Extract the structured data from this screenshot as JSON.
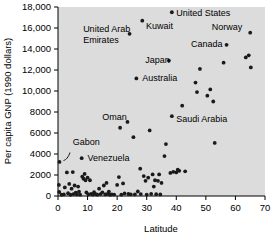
{
  "chart_data": {
    "type": "scatter",
    "title": "",
    "xlabel": "Latitude",
    "ylabel": "Per capita GNP (1990 dollars)",
    "xlim": [
      0,
      70
    ],
    "ylim": [
      0,
      18000
    ],
    "xticks": [
      0,
      10,
      20,
      30,
      40,
      50,
      60,
      70
    ],
    "xtick_labels": [
      "0",
      "10",
      "20",
      "30",
      "40",
      "50",
      "60",
      "70"
    ],
    "yticks": [
      0,
      2000,
      4000,
      6000,
      8000,
      10000,
      12000,
      14000,
      16000,
      18000
    ],
    "ytick_labels": [
      "0",
      "2000",
      "4000",
      "6000",
      "8000",
      "10,000",
      "12,000",
      "14,000",
      "16,000",
      "18,000"
    ],
    "grid": false,
    "legend": false,
    "plot_background": "#dcdcdc",
    "marker_color": "#1a1a1a",
    "annotations": [
      {
        "text": "United Arab",
        "x": 24.2,
        "y": 15450,
        "label_x": 8.5,
        "label_y": 15900,
        "align": "start",
        "line2": "Emirates"
      },
      {
        "text": "Kuwait",
        "x": 28.5,
        "y": 16700,
        "label_x": 29.8,
        "label_y": 16150,
        "align": "start"
      },
      {
        "text": "United States",
        "x": 38.5,
        "y": 17500,
        "label_x": 40.0,
        "label_y": 17450,
        "align": "start"
      },
      {
        "text": "Norway",
        "x": 65.0,
        "y": 15550,
        "label_x": 52.0,
        "label_y": 16050,
        "align": "start"
      },
      {
        "text": "Canada",
        "x": 57.0,
        "y": 14400,
        "label_x": 45.0,
        "label_y": 14450,
        "align": "start"
      },
      {
        "text": "Japan",
        "x": 37.5,
        "y": 12900,
        "label_x": 29.5,
        "label_y": 12950,
        "align": "start"
      },
      {
        "text": "Australia",
        "x": 26.5,
        "y": 11200,
        "label_x": 28.5,
        "label_y": 11200,
        "align": "start"
      },
      {
        "text": "Oman",
        "x": 23.5,
        "y": 7050,
        "label_x": 15.0,
        "label_y": 7550,
        "align": "start"
      },
      {
        "text": "Saudi Arabia",
        "x": 38.5,
        "y": 7600,
        "label_x": 40.0,
        "label_y": 7300,
        "align": "start"
      },
      {
        "text": "Gabon",
        "x": 0.5,
        "y": 3250,
        "label_x": 5.0,
        "label_y": 5100,
        "align": "start"
      },
      {
        "text": "Venezuela",
        "x": 8.0,
        "y": 3600,
        "label_x": 10.0,
        "label_y": 3600,
        "align": "start"
      }
    ],
    "points": [
      {
        "x": 0.5,
        "y": 3250
      },
      {
        "x": 0.3,
        "y": 1050
      },
      {
        "x": 0.4,
        "y": 380
      },
      {
        "x": 1.2,
        "y": 120
      },
      {
        "x": 2.0,
        "y": 150
      },
      {
        "x": 2.3,
        "y": 820
      },
      {
        "x": 3.0,
        "y": 2250
      },
      {
        "x": 3.4,
        "y": 260
      },
      {
        "x": 3.8,
        "y": 1150
      },
      {
        "x": 4.2,
        "y": 120
      },
      {
        "x": 4.6,
        "y": 700
      },
      {
        "x": 5.0,
        "y": 2280
      },
      {
        "x": 5.2,
        "y": 180
      },
      {
        "x": 5.6,
        "y": 1000
      },
      {
        "x": 6.0,
        "y": 330
      },
      {
        "x": 6.4,
        "y": 150
      },
      {
        "x": 6.8,
        "y": 900
      },
      {
        "x": 7.1,
        "y": 420
      },
      {
        "x": 7.5,
        "y": 130
      },
      {
        "x": 8.0,
        "y": 3600
      },
      {
        "x": 8.2,
        "y": 1850
      },
      {
        "x": 8.6,
        "y": 1650
      },
      {
        "x": 9.0,
        "y": 2100
      },
      {
        "x": 9.3,
        "y": 1500
      },
      {
        "x": 9.6,
        "y": 340
      },
      {
        "x": 10.0,
        "y": 1750
      },
      {
        "x": 10.3,
        "y": 160
      },
      {
        "x": 10.8,
        "y": 1500
      },
      {
        "x": 11.2,
        "y": 200
      },
      {
        "x": 11.8,
        "y": 140
      },
      {
        "x": 12.2,
        "y": 360
      },
      {
        "x": 12.8,
        "y": 170
      },
      {
        "x": 13.3,
        "y": 130
      },
      {
        "x": 13.9,
        "y": 700
      },
      {
        "x": 14.4,
        "y": 180
      },
      {
        "x": 15.0,
        "y": 350
      },
      {
        "x": 15.5,
        "y": 1000
      },
      {
        "x": 16.0,
        "y": 150
      },
      {
        "x": 16.4,
        "y": 1250
      },
      {
        "x": 16.8,
        "y": 200
      },
      {
        "x": 17.2,
        "y": 420
      },
      {
        "x": 17.6,
        "y": 120
      },
      {
        "x": 18.2,
        "y": 160
      },
      {
        "x": 19.0,
        "y": 140
      },
      {
        "x": 20.0,
        "y": 1050
      },
      {
        "x": 20.6,
        "y": 1800
      },
      {
        "x": 21.0,
        "y": 6500
      },
      {
        "x": 21.4,
        "y": 130
      },
      {
        "x": 22.0,
        "y": 1200
      },
      {
        "x": 22.5,
        "y": 250
      },
      {
        "x": 23.5,
        "y": 7050
      },
      {
        "x": 23.8,
        "y": 190
      },
      {
        "x": 24.2,
        "y": 15450
      },
      {
        "x": 24.6,
        "y": 160
      },
      {
        "x": 25.5,
        "y": 5600
      },
      {
        "x": 26.0,
        "y": 150
      },
      {
        "x": 26.5,
        "y": 11200
      },
      {
        "x": 27.0,
        "y": 430
      },
      {
        "x": 27.8,
        "y": 2600
      },
      {
        "x": 28.0,
        "y": 180
      },
      {
        "x": 28.5,
        "y": 16700
      },
      {
        "x": 29.0,
        "y": 1900
      },
      {
        "x": 29.6,
        "y": 1450
      },
      {
        "x": 30.0,
        "y": 140
      },
      {
        "x": 30.5,
        "y": 1750
      },
      {
        "x": 31.0,
        "y": 6250
      },
      {
        "x": 31.5,
        "y": 200
      },
      {
        "x": 32.0,
        "y": 2050
      },
      {
        "x": 32.4,
        "y": 900
      },
      {
        "x": 32.8,
        "y": 1500
      },
      {
        "x": 33.2,
        "y": 170
      },
      {
        "x": 33.8,
        "y": 1450
      },
      {
        "x": 34.2,
        "y": 2050
      },
      {
        "x": 34.6,
        "y": 150
      },
      {
        "x": 35.0,
        "y": 1250
      },
      {
        "x": 36.0,
        "y": 3800
      },
      {
        "x": 36.5,
        "y": 4950
      },
      {
        "x": 37.5,
        "y": 12900
      },
      {
        "x": 38.0,
        "y": 2200
      },
      {
        "x": 38.5,
        "y": 17500
      },
      {
        "x": 38.5,
        "y": 7600
      },
      {
        "x": 39.0,
        "y": 2300
      },
      {
        "x": 40.0,
        "y": 2250
      },
      {
        "x": 40.5,
        "y": 2500
      },
      {
        "x": 41.0,
        "y": 2400
      },
      {
        "x": 42.0,
        "y": 8600
      },
      {
        "x": 43.0,
        "y": 2350
      },
      {
        "x": 46.5,
        "y": 10800
      },
      {
        "x": 47.0,
        "y": 9900
      },
      {
        "x": 48.0,
        "y": 12100
      },
      {
        "x": 50.5,
        "y": 9550
      },
      {
        "x": 51.5,
        "y": 10150
      },
      {
        "x": 52.5,
        "y": 9000
      },
      {
        "x": 53.0,
        "y": 5050
      },
      {
        "x": 56.0,
        "y": 12700
      },
      {
        "x": 57.0,
        "y": 14400
      },
      {
        "x": 63.5,
        "y": 13200
      },
      {
        "x": 64.5,
        "y": 13400
      },
      {
        "x": 65.0,
        "y": 15550
      },
      {
        "x": 65.2,
        "y": 12250
      }
    ]
  }
}
